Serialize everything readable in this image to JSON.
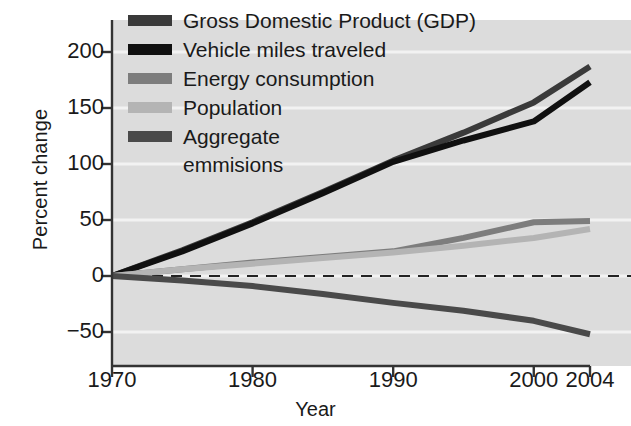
{
  "chart_data": {
    "type": "line",
    "title": "",
    "xlabel": "Year",
    "ylabel": "Percent change",
    "xlim": [
      1970,
      2004
    ],
    "ylim": [
      -75,
      225
    ],
    "xticks": [
      1970,
      1980,
      1990,
      2000,
      2004
    ],
    "yticks": [
      -50,
      0,
      50,
      100,
      150,
      200
    ],
    "grid": "horizontal-faint",
    "legend_position": "top-left",
    "zero_reference_line": {
      "value": 0,
      "style": "dashed"
    },
    "x": [
      1970,
      1975,
      1980,
      1985,
      1990,
      1995,
      2000,
      2004
    ],
    "series": [
      {
        "name": "Gross Domestic Product (GDP)",
        "color": "#3a3a3a",
        "values": [
          0,
          23,
          48,
          75,
          103,
          128,
          155,
          187
        ]
      },
      {
        "name": "Vehicle miles traveled",
        "color": "#101010",
        "values": [
          0,
          22,
          47,
          74,
          102,
          121,
          138,
          173
        ]
      },
      {
        "name": "Energy consumption",
        "color": "#7d7d7d",
        "values": [
          0,
          6,
          12,
          17,
          22,
          34,
          48,
          49
        ]
      },
      {
        "name": "Population",
        "color": "#b4b4b4",
        "values": [
          0,
          6,
          11,
          16,
          21,
          27,
          34,
          42
        ]
      },
      {
        "name": "Aggregate emmisions",
        "color": "#4a4a4a",
        "values": [
          0,
          -4,
          -9,
          -16,
          -24,
          -31,
          -40,
          -52
        ]
      }
    ]
  },
  "axes": {
    "y_title": "Percent change",
    "x_title": "Year",
    "y_tick_labels": [
      "200",
      "150",
      "100",
      "50",
      "0",
      "−50"
    ],
    "x_tick_labels": [
      "1970",
      "1980",
      "1990",
      "2000",
      "2004"
    ]
  },
  "legend": {
    "items": [
      {
        "label": "Gross Domestic Product (GDP)",
        "color": "#3a3a3a"
      },
      {
        "label": "Vehicle miles traveled",
        "color": "#101010"
      },
      {
        "label": "Energy consumption",
        "color": "#7d7d7d"
      },
      {
        "label": "Population",
        "color": "#b4b4b4"
      },
      {
        "label": "Aggregate",
        "label2": "emmisions",
        "color": "#4a4a4a"
      }
    ]
  },
  "colors": {
    "plot_background": "#dcdcdc",
    "axis": "#333333",
    "text": "#1a1a1a",
    "gridline": "#f2f2f2"
  }
}
